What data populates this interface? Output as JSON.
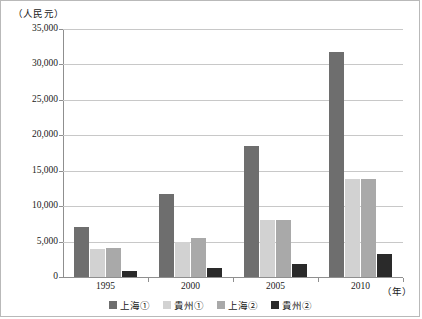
{
  "chart_data": {
    "type": "bar",
    "title": "",
    "xlabel": "（年）",
    "ylabel": "（人民元）",
    "categories": [
      "1995",
      "2000",
      "2005",
      "2010"
    ],
    "ylim": [
      0,
      35000
    ],
    "ytick_labels": [
      "0",
      "5,000",
      "10,000",
      "15,000",
      "20,000",
      "25,000",
      "30,000",
      "35,000"
    ],
    "ytick_values": [
      0,
      5000,
      10000,
      15000,
      20000,
      25000,
      30000,
      35000
    ],
    "grid": true,
    "legend_position": "bottom",
    "series": [
      {
        "name": "上海①",
        "color": "#6e6e6e",
        "values": [
          7100,
          11700,
          18500,
          31700
        ]
      },
      {
        "name": "貴州①",
        "color": "#d2d2d2",
        "values": [
          3900,
          5000,
          8000,
          13900
        ]
      },
      {
        "name": "上海②",
        "color": "#a9a9a9",
        "values": [
          4100,
          5500,
          8100,
          13800
        ]
      },
      {
        "name": "貴州②",
        "color": "#2a2a2a",
        "values": [
          900,
          1300,
          1800,
          3300
        ]
      }
    ]
  }
}
